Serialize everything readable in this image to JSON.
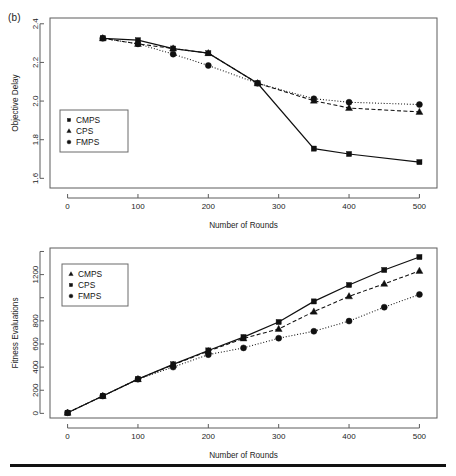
{
  "figure": {
    "panel_tag": "(b)",
    "rule_color": "#111111"
  },
  "chart_data": [
    {
      "id": "objective-delay",
      "type": "line",
      "title": "",
      "xlabel": "Number of Rounds",
      "ylabel": "Objective Delay",
      "xlim": [
        -25,
        525
      ],
      "ylim": [
        1.55,
        2.43
      ],
      "xticks": [
        0,
        100,
        200,
        300,
        400,
        500
      ],
      "xticklabels": [
        "0",
        "100",
        "200",
        "300",
        "400",
        "500"
      ],
      "yticks": [
        1.6,
        1.8,
        2.0,
        2.2,
        2.4
      ],
      "yticklabels": [
        "1.6",
        "1.8",
        "2.0",
        "2.2",
        "2.4"
      ],
      "grid": false,
      "legend_position": "lower-left-inset",
      "legend_entries": [
        "CMPS",
        "CPS",
        "FMPS"
      ],
      "series": [
        {
          "name": "CMPS",
          "marker": "square",
          "linestyle": "solid",
          "color": "#101010",
          "x": [
            50,
            100,
            150,
            200,
            270,
            350,
            400,
            500
          ],
          "values": [
            2.325,
            2.315,
            2.272,
            2.248,
            2.092,
            1.754,
            1.726,
            1.684
          ]
        },
        {
          "name": "CPS",
          "marker": "triangle",
          "linestyle": "dashed",
          "color": "#101010",
          "x": [
            50,
            100,
            150,
            200,
            270,
            350,
            400,
            500
          ],
          "values": [
            2.325,
            2.296,
            2.272,
            2.248,
            2.092,
            2.002,
            1.964,
            1.944
          ]
        },
        {
          "name": "FMPS",
          "marker": "circle",
          "linestyle": "dotted",
          "color": "#101010",
          "x": [
            50,
            100,
            150,
            200,
            270,
            350,
            400,
            500
          ],
          "values": [
            2.325,
            2.296,
            2.243,
            2.184,
            2.092,
            2.012,
            1.994,
            1.982
          ]
        }
      ]
    },
    {
      "id": "fitness-evaluations",
      "type": "line",
      "title": "",
      "xlabel": "Number of Rounds",
      "ylabel": "Fitness Evaluations",
      "xlim": [
        -25,
        525
      ],
      "ylim": [
        -40,
        1430
      ],
      "xticks": [
        0,
        100,
        200,
        300,
        400,
        500
      ],
      "xticklabels": [
        "0",
        "100",
        "200",
        "300",
        "400",
        "500"
      ],
      "yticks": [
        0,
        200,
        400,
        600,
        800,
        1000,
        1200,
        1400
      ],
      "yticklabels": [
        "0",
        "200",
        "400",
        "600",
        "800",
        "",
        "1200",
        ""
      ],
      "grid": false,
      "legend_position": "upper-left-inset",
      "legend_entries": [
        "CMPS",
        "CPS",
        "FMPS"
      ],
      "series": [
        {
          "name": "CMPS",
          "marker": "triangle",
          "linestyle": "dashed",
          "color": "#101010",
          "x": [
            0,
            50,
            100,
            150,
            200,
            250,
            300,
            350,
            400,
            450,
            500
          ],
          "values": [
            5,
            150,
            296,
            420,
            538,
            648,
            730,
            880,
            1012,
            1120,
            1232
          ]
        },
        {
          "name": "CPS",
          "marker": "square",
          "linestyle": "solid",
          "color": "#101010",
          "x": [
            0,
            50,
            100,
            150,
            200,
            250,
            300,
            350,
            400,
            450,
            500
          ],
          "values": [
            5,
            150,
            296,
            424,
            544,
            660,
            790,
            968,
            1110,
            1240,
            1352
          ]
        },
        {
          "name": "FMPS",
          "marker": "circle",
          "linestyle": "dotted",
          "color": "#101010",
          "x": [
            0,
            50,
            100,
            150,
            200,
            250,
            300,
            350,
            400,
            450,
            500
          ],
          "values": [
            5,
            150,
            296,
            400,
            508,
            566,
            650,
            710,
            798,
            918,
            1028
          ]
        }
      ]
    }
  ]
}
